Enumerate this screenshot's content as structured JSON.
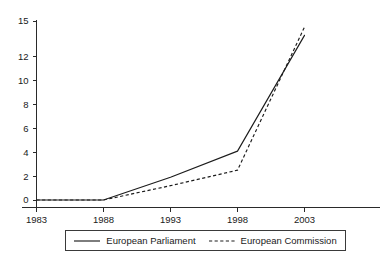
{
  "chart_data": {
    "type": "line",
    "title": "",
    "subtitle": "",
    "xlabel": "",
    "ylabel": "",
    "x": [
      1983,
      1988,
      1993,
      1998,
      2003
    ],
    "xlim": [
      1983,
      2005
    ],
    "ylim": [
      0,
      15
    ],
    "grid": false,
    "legend_position": "bottom",
    "x_tick_labels": [
      "1983",
      "1988",
      "1993",
      "1998",
      "2003"
    ],
    "y_tick_labels": [
      "0",
      "2",
      "4",
      "6",
      "8",
      "10",
      "12",
      "15"
    ],
    "y_tick_values": [
      0,
      2,
      4,
      6,
      8,
      10,
      12,
      15
    ],
    "series": [
      {
        "name": "European Parliament",
        "style": "solid",
        "color": "#1c1c1c",
        "values": [
          0,
          0,
          1.9,
          4.1,
          13.8
        ]
      },
      {
        "name": "European Commission",
        "style": "dashed",
        "color": "#1c1c1c",
        "values": [
          0,
          0,
          1.2,
          2.5,
          14.5
        ]
      }
    ],
    "legend": [
      {
        "label": "European Parliament",
        "style": "solid"
      },
      {
        "label": "European Commission",
        "style": "dashed"
      }
    ]
  }
}
